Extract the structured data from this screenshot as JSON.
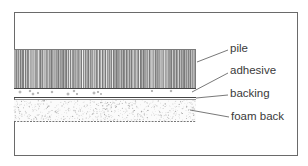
{
  "diagram": {
    "layers": [
      {
        "id": "pile",
        "label": "pile"
      },
      {
        "id": "adhesive",
        "label": "adhesive"
      },
      {
        "id": "backing",
        "label": "backing"
      },
      {
        "id": "foam-back",
        "label": "foam back"
      }
    ],
    "colors": {
      "ink": "#3a3a3a",
      "pile_dark": "#5a5a5a",
      "frame": "#6a6a6a",
      "background": "#ffffff"
    }
  }
}
